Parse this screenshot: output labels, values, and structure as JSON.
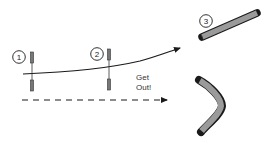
{
  "diagram": {
    "markers": [
      {
        "label": "1"
      },
      {
        "label": "2"
      },
      {
        "label": "3"
      }
    ],
    "text": {
      "line1": "Get",
      "line2": "Out!"
    },
    "colors": {
      "stroke": "#1a1a1a",
      "pipe_fill": "#9a9a9a",
      "gate_fill": "#777777",
      "background": "#ffffff"
    },
    "elements": {
      "gates": [
        "gate-1",
        "gate-2"
      ],
      "paths": [
        "curved-solid-arrow",
        "dashed-straight-arrow"
      ],
      "pipes": [
        "straight-pipe",
        "curved-pipe"
      ]
    }
  }
}
